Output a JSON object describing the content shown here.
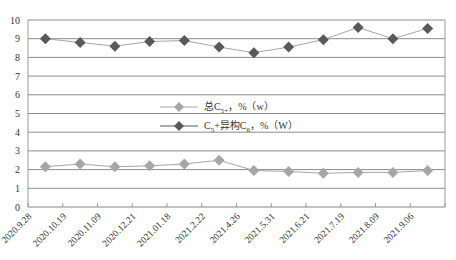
{
  "chart_data": {
    "type": "line",
    "title": "",
    "xlabel": "",
    "ylabel": "",
    "ylim": [
      0,
      10
    ],
    "yticks": [
      0,
      1,
      2,
      3,
      4,
      5,
      6,
      7,
      8,
      9,
      10
    ],
    "grid": true,
    "legend_position": "center",
    "categories": [
      "2020.9.28",
      "2020.10.19",
      "2020.11.09",
      "2020.12.21",
      "2021.01.18",
      "2021.2.22",
      "2021.4.26",
      "2021.5.31",
      "2021.6.21",
      "2021.7.19",
      "2021.8.09",
      "2021.9.06"
    ],
    "series": [
      {
        "name": "总C5+, %（w）",
        "label_main": "总C",
        "label_sub": "5+",
        "label_tail": "，%（w）",
        "color": "#a6a6a6",
        "marker": "diamond",
        "values": [
          2.15,
          2.3,
          2.15,
          2.2,
          2.3,
          2.5,
          1.95,
          1.9,
          1.8,
          1.85,
          1.85,
          1.95
        ]
      },
      {
        "name": "C5+异构C6, %（W）",
        "label_main": "C",
        "label_sub": "5",
        "label_mid": "+异构C",
        "label_sub2": "6",
        "label_tail": "，%（W）",
        "color": "#595959",
        "marker": "diamond",
        "values": [
          9.0,
          8.8,
          8.6,
          8.85,
          8.9,
          8.55,
          8.25,
          8.55,
          8.95,
          9.6,
          9.0,
          9.55
        ]
      }
    ]
  }
}
